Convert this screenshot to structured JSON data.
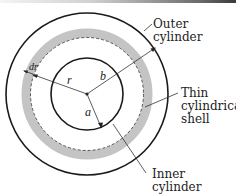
{
  "diagram": {
    "type": "coaxial cylinders cross-section",
    "colors": {
      "line": "#1a1a1a",
      "shell_fill": "#c4c4c4",
      "background": "#ffffff"
    },
    "labels": {
      "outer_cylinder": [
        "Outer",
        "cylinder"
      ],
      "thin_shell": [
        "Thin",
        "cylindrical",
        "shell"
      ],
      "inner_cylinder": [
        "Inner",
        "cylinder"
      ],
      "radius_r": "r",
      "radius_b": "b",
      "radius_a": "a",
      "thickness_dr": "dr"
    }
  }
}
